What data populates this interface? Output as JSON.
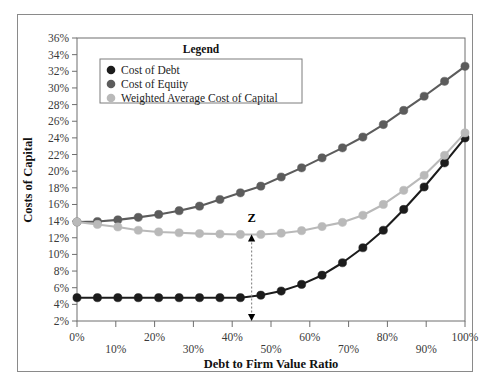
{
  "chart_data": {
    "type": "line",
    "title": "",
    "xlabel": "Debt to Firm Value Ratio",
    "ylabel": "Costs of Capital",
    "xlim": [
      0,
      100
    ],
    "ylim": [
      2,
      36
    ],
    "grid": false,
    "legend_position": "top-left-inside",
    "legend_title": "Legend",
    "x_tick_labels": [
      "0%",
      "10%",
      "20%",
      "30%",
      "40%",
      "50%",
      "60%",
      "70%",
      "80%",
      "90%",
      "100%"
    ],
    "x_tick_values": [
      0,
      10,
      20,
      30,
      40,
      50,
      60,
      70,
      80,
      90,
      100
    ],
    "y_tick_labels": [
      "2%",
      "4%",
      "6%",
      "8%",
      "10%",
      "12%",
      "14%",
      "16%",
      "18%",
      "20%",
      "22%",
      "24%",
      "26%",
      "28%",
      "30%",
      "32%",
      "34%",
      "36%"
    ],
    "y_tick_values": [
      2,
      4,
      6,
      8,
      10,
      12,
      14,
      16,
      18,
      20,
      22,
      24,
      26,
      28,
      30,
      32,
      34,
      36
    ],
    "x": [
      0,
      5.26,
      10.53,
      15.79,
      21.05,
      26.32,
      31.58,
      36.84,
      42.11,
      47.37,
      52.63,
      57.89,
      63.16,
      68.42,
      73.68,
      78.95,
      84.21,
      89.47,
      94.74,
      100
    ],
    "series": [
      {
        "name": "Cost of Debt",
        "color": "#1c1c1c",
        "values": [
          4.8,
          4.8,
          4.8,
          4.8,
          4.8,
          4.8,
          4.8,
          4.8,
          4.8,
          5.1,
          5.6,
          6.4,
          7.5,
          9.0,
          10.8,
          12.9,
          15.4,
          18.1,
          21.0,
          24.0
        ]
      },
      {
        "name": "Cost of Equity",
        "color": "#5c5c5c",
        "values": [
          13.9,
          13.95,
          14.15,
          14.45,
          14.8,
          15.25,
          15.8,
          16.6,
          17.4,
          18.2,
          19.3,
          20.4,
          21.6,
          22.8,
          24.1,
          25.6,
          27.3,
          29.0,
          30.8,
          32.6
        ]
      },
      {
        "name": "Weighted Average Cost of Capital",
        "color": "#b9b9b9",
        "values": [
          13.9,
          13.6,
          13.3,
          12.9,
          12.7,
          12.6,
          12.5,
          12.45,
          12.4,
          12.4,
          12.55,
          12.85,
          13.35,
          13.85,
          14.7,
          16.0,
          17.7,
          19.5,
          21.9,
          24.6
        ]
      }
    ],
    "annotations": [
      {
        "label": "Z",
        "type": "double-headed-vertical-dotted-arrow",
        "x": 45,
        "y_top": 12.4,
        "y_bottom": 2,
        "label_x": 45,
        "label_y": 14.4
      }
    ]
  },
  "legend": {
    "title": "Legend",
    "entries": [
      {
        "label": "Cost of Debt",
        "color": "#1c1c1c"
      },
      {
        "label": "Cost of Equity",
        "color": "#5c5c5c"
      },
      {
        "label": "Weighted Average Cost of Capital",
        "color": "#b9b9b9"
      }
    ]
  },
  "axes": {
    "x_title": "Debt to Firm Value Ratio",
    "y_title": "Costs of Capital"
  },
  "colors": {
    "frame": "#8a8a8a",
    "axis": "#6e6e6e",
    "background": "#ffffff",
    "text": "#1d1d1d"
  }
}
